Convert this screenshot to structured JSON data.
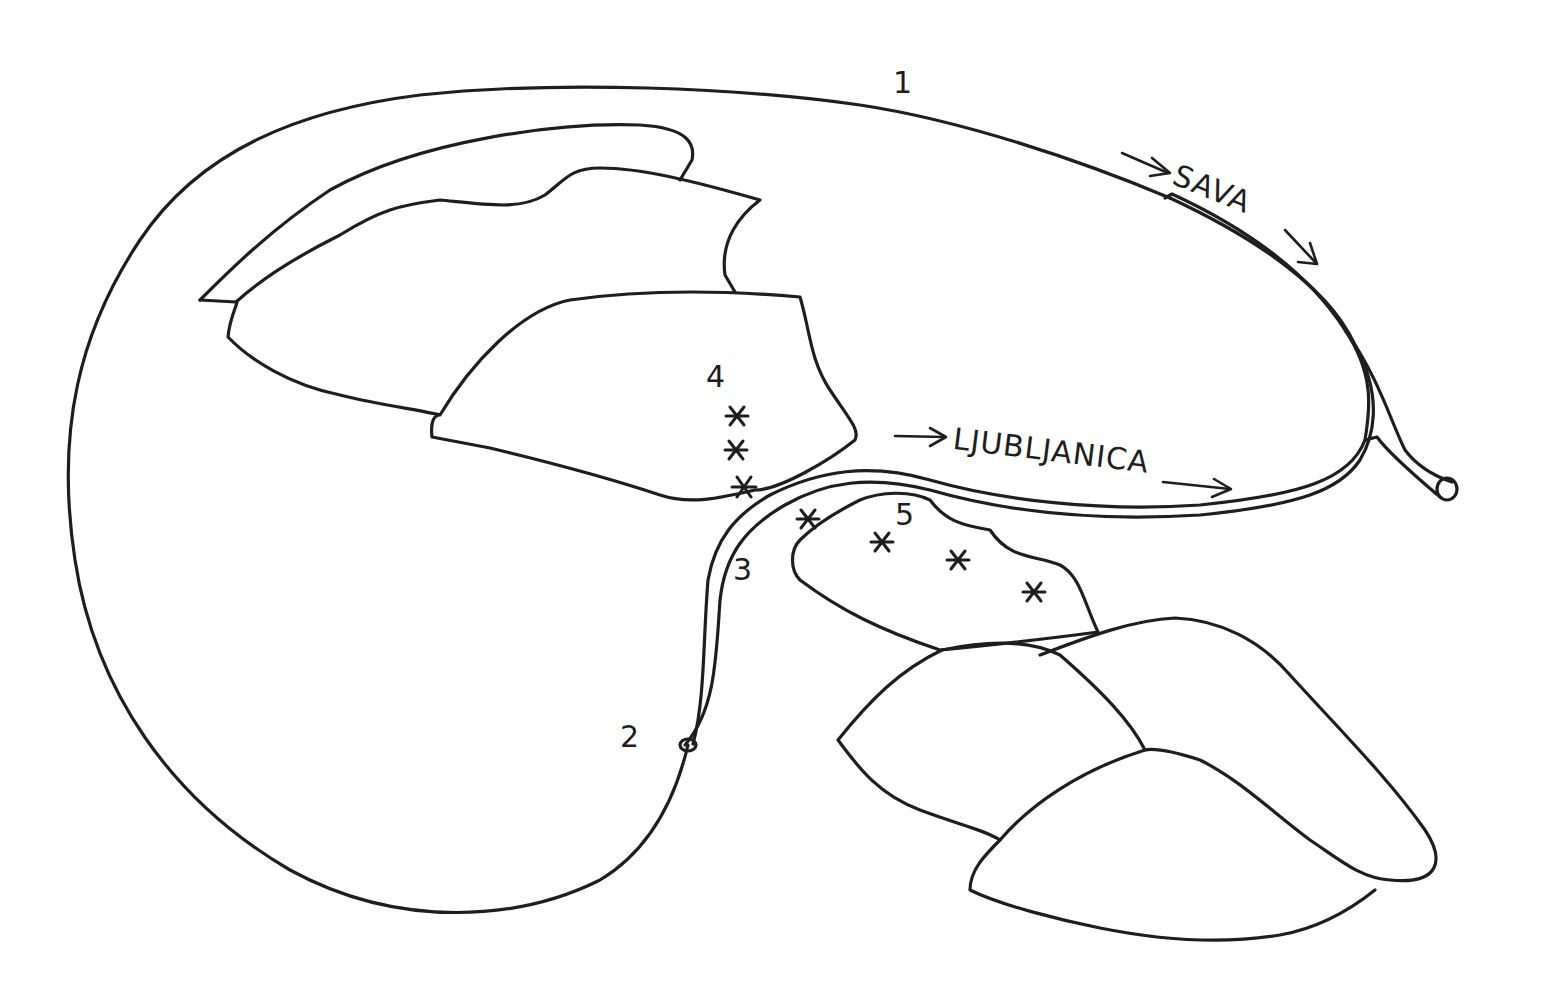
{
  "diagram": {
    "type": "hand-drawn schematic map",
    "labels": {
      "n1": "1",
      "n2": "2",
      "n3": "3",
      "n4": "4",
      "n5": "5",
      "river_sava": "SAVA",
      "river_ljubljanica": "LJUBLJANICA"
    },
    "arrows": {
      "sava_in": "→",
      "sava_out": "→",
      "ljubljanica_in": "→",
      "ljubljanica_out": "→"
    },
    "markers": {
      "symbol": "*",
      "group_4_count": 3,
      "group_5_count": 4
    },
    "colors": {
      "ink": "#1e1e1e",
      "paper": "#ffffff"
    }
  }
}
